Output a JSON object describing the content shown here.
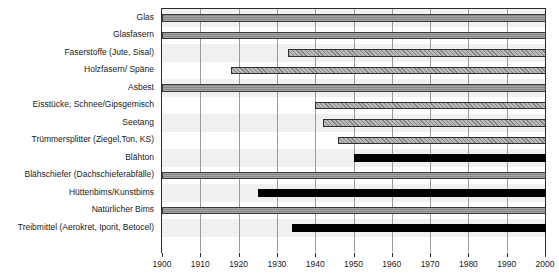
{
  "chart_data": {
    "type": "bar",
    "subtype": "timeline-gantt",
    "title": "",
    "xlabel": "",
    "ylabel": "",
    "xlim": [
      1900,
      2000
    ],
    "grid": true,
    "legend": "none",
    "xticks": [
      1900,
      1910,
      1920,
      1930,
      1940,
      1950,
      1960,
      1970,
      1980,
      1990,
      2000
    ],
    "xticklabels": [
      "1900",
      "1910",
      "1920",
      "1930",
      "1940",
      "1950",
      "1960",
      "1970",
      "1980",
      "1990",
      "2000"
    ],
    "categories": [
      "Glas",
      "Glasfasern",
      "Faserstoffe (Jute, Sisal)",
      "Holzfasern/ Späne",
      "Asbest",
      "Eisstücke, Schnee/Gipsgemisch",
      "Seetang",
      "Trümmersplitter (Ziegel,Ton, KS)",
      "Blähton",
      "Blähschiefer (Dachschieferabfälle)",
      "Hüttenbims/Kunstbims",
      "Natürlicher Bims",
      "Treibmittel (Aerokret, Iporit, Betocel)"
    ],
    "series": [
      {
        "name": "Einsatzzeitraum",
        "bars": [
          {
            "category": "Glas",
            "start": 1900,
            "end": 2000,
            "style": "solid-gray"
          },
          {
            "category": "Glasfasern",
            "start": 1900,
            "end": 2000,
            "style": "solid-gray"
          },
          {
            "category": "Faserstoffe (Jute, Sisal)",
            "start": 1933,
            "end": 2000,
            "style": "hatched"
          },
          {
            "category": "Holzfasern/ Späne",
            "start": 1918,
            "end": 2000,
            "style": "hatched"
          },
          {
            "category": "Asbest",
            "start": 1900,
            "end": 2000,
            "style": "solid-gray"
          },
          {
            "category": "Eisstücke, Schnee/Gipsgemisch",
            "start": 1940,
            "end": 2000,
            "style": "hatched"
          },
          {
            "category": "Seetang",
            "start": 1942,
            "end": 2000,
            "style": "hatched"
          },
          {
            "category": "Trümmersplitter (Ziegel,Ton, KS)",
            "start": 1946,
            "end": 2000,
            "style": "hatched"
          },
          {
            "category": "Blähton",
            "start": 1950,
            "end": 2000,
            "style": "black"
          },
          {
            "category": "Blähschiefer (Dachschieferabfälle)",
            "start": 1900,
            "end": 2000,
            "style": "solid-gray"
          },
          {
            "category": "Hüttenbims/Kunstbims",
            "start": 1925,
            "end": 2000,
            "style": "black"
          },
          {
            "category": "Natürlicher Bims",
            "start": 1900,
            "end": 2000,
            "style": "solid-gray"
          },
          {
            "category": "Treibmittel (Aerokret, Iporit, Betocel)",
            "start": 1934,
            "end": 2000,
            "style": "black"
          }
        ]
      }
    ],
    "colors": {
      "solid-gray": "#8a8a8a",
      "hatched": "#b9b9b9",
      "black": "#000000",
      "row_band": "#f0f0f0",
      "gridline": "#9a9a9a",
      "frame": "#2b2b2b",
      "text": "#1a1a1a"
    }
  }
}
